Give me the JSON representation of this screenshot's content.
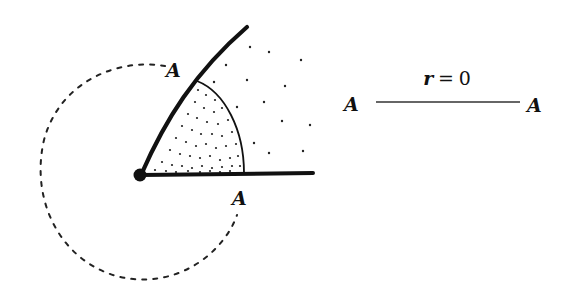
{
  "diagram": {
    "left_figure": {
      "vertex_label": "",
      "upper_ray_label": "A",
      "lower_ray_label": "A",
      "shaded_sector": "stippled wedge between rays",
      "dotted_circle": "dotted loop around vertex"
    },
    "right_figure": {
      "left_end_label": "A",
      "right_end_label": "A",
      "segment_label_var": "r",
      "segment_label_op": "=",
      "segment_label_val": "0"
    }
  },
  "colors": {
    "ink": "#111111",
    "background": "#ffffff"
  }
}
